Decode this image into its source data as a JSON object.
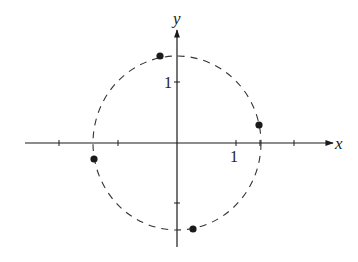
{
  "figure": {
    "type": "complex-plane-roots",
    "axes": {
      "x_label": "x",
      "y_label": "y",
      "x_tick_label": "1",
      "y_tick_label": "1",
      "origin_px": [
        177,
        143
      ],
      "unit_px": 59
    },
    "circle": {
      "style": "dashed",
      "center_px": [
        177,
        143
      ],
      "rx_px": 84,
      "ry_px": 87
    },
    "points": [
      {
        "name": "point-top",
        "px": [
          160,
          56
        ]
      },
      {
        "name": "point-right",
        "px": [
          259,
          125
        ]
      },
      {
        "name": "point-left",
        "px": [
          94,
          159
        ]
      },
      {
        "name": "point-bottom",
        "px": [
          193,
          229
        ]
      }
    ],
    "colors": {
      "ink": "#1a1a1a",
      "background": "#ffffff"
    }
  }
}
